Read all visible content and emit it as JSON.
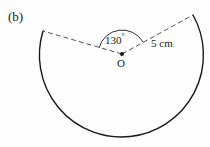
{
  "figure": {
    "part_label": "(b)",
    "angle_value": "130",
    "angle_degree_symbol": "°",
    "center_label": "O",
    "radius_label": "5 cm",
    "background_color": "#fdfdfd",
    "stroke_color": "#1a1a1a",
    "dash_color": "#555555"
  },
  "geometry": {
    "center_x": 122,
    "center_y": 54,
    "radius_px": 82,
    "sector_angle_deg": 130,
    "reflex_arc_deg": 230,
    "radius_length_cm": 5,
    "left_endpoint_x": 43,
    "left_endpoint_y": 31,
    "right_endpoint_x": 193,
    "right_endpoint_y": 15
  }
}
